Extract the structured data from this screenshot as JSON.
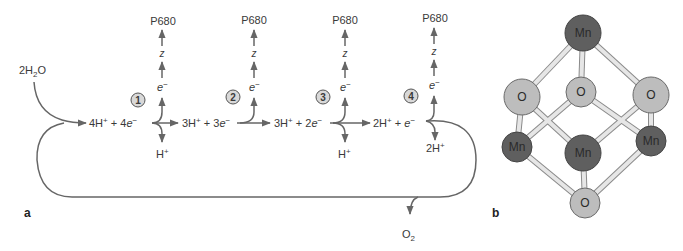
{
  "panel_a": {
    "label": "a",
    "reactant": {
      "prefix": "2H",
      "sub": "2",
      "suffix": "O"
    },
    "states": [
      {
        "h_count": "4H",
        "sup": "+",
        "plus": " + 4",
        "e": "e",
        "esup": "−"
      },
      {
        "h_count": "3H",
        "sup": "+",
        "plus": " + 3",
        "e": "e",
        "esup": "−"
      },
      {
        "h_count": "3H",
        "sup": "+",
        "plus": " + 2",
        "e": "e",
        "esup": "−"
      },
      {
        "h_count": "2H",
        "sup": "+",
        "plus": " + ",
        "e": "e",
        "esup": "−"
      }
    ],
    "steps": [
      {
        "number": "1",
        "acceptor": "P680",
        "carrier": "z",
        "electron": "e",
        "electron_sup": "−",
        "proton": "H",
        "proton_sup": "+"
      },
      {
        "number": "2",
        "acceptor": "P680",
        "carrier": "z",
        "electron": "e",
        "electron_sup": "−",
        "proton": "",
        "proton_sup": ""
      },
      {
        "number": "3",
        "acceptor": "P680",
        "carrier": "z",
        "electron": "e",
        "electron_sup": "−",
        "proton": "H",
        "proton_sup": "+"
      },
      {
        "number": "4",
        "acceptor": "P680",
        "carrier": "z",
        "electron": "e",
        "electron_sup": "−",
        "proton": "2H",
        "proton_sup": "+"
      }
    ],
    "product": {
      "prefix": "O",
      "sub": "2"
    }
  },
  "panel_b": {
    "label": "b",
    "atoms": [
      {
        "id": "mn-top",
        "symbol": "Mn",
        "type": "Mn"
      },
      {
        "id": "o-left",
        "symbol": "O",
        "type": "O"
      },
      {
        "id": "o-center",
        "symbol": "O",
        "type": "O"
      },
      {
        "id": "o-right",
        "symbol": "O",
        "type": "O"
      },
      {
        "id": "mn-left",
        "symbol": "Mn",
        "type": "Mn"
      },
      {
        "id": "mn-center",
        "symbol": "Mn",
        "type": "Mn"
      },
      {
        "id": "mn-right",
        "symbol": "Mn",
        "type": "Mn"
      },
      {
        "id": "o-bottom",
        "symbol": "O",
        "type": "O"
      }
    ]
  },
  "colors": {
    "line": "#666666",
    "mn_fill": "#5f5f5f",
    "o_fill": "#bdbdbd",
    "bond_fill": "#e6e6e6",
    "bond_stroke": "#8a8a8a",
    "circle_num_fill": "#d8d8d8"
  }
}
